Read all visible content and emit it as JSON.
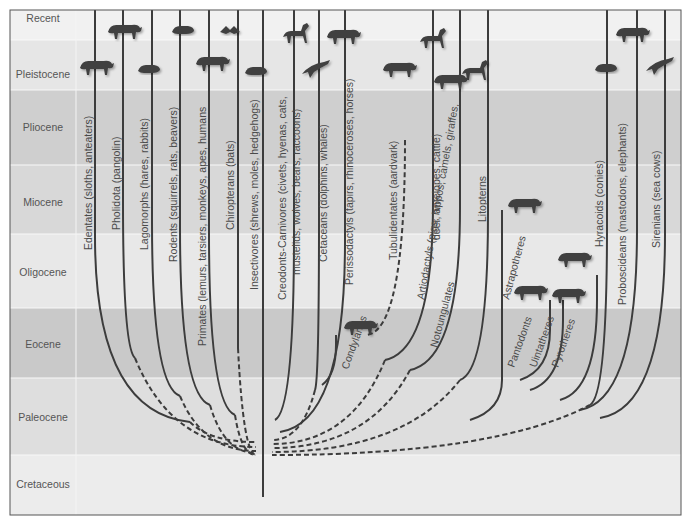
{
  "figure": {
    "type": "phylogenetic-tree",
    "topic": "Evolution of placental mammal orders through the Cenozoic",
    "frame": {
      "left": 10,
      "top": 10,
      "right": 681,
      "bottom": 515,
      "label_column_right": 76
    },
    "colors": {
      "line": "#3c3c3c",
      "animal": "#3f3f3f",
      "label_text": "#4a4a4a",
      "period_text": "#555555",
      "border": "#555555"
    }
  },
  "periods": [
    {
      "name": "Recent",
      "y0": 10,
      "y1": 40,
      "color": "#f1f1f1",
      "label_y": 22
    },
    {
      "name": "Pleistocene",
      "y0": 40,
      "y1": 90,
      "color": "#e6e6e6",
      "label_y": 78
    },
    {
      "name": "Pliocene",
      "y0": 90,
      "y1": 165,
      "color": "#cfcfcf",
      "label_y": 131
    },
    {
      "name": "Miocene",
      "y0": 165,
      "y1": 234,
      "color": "#d8d8d8",
      "label_y": 206
    },
    {
      "name": "Oligocene",
      "y0": 234,
      "y1": 308,
      "color": "#e8e8e8",
      "label_y": 276
    },
    {
      "name": "Eocene",
      "y0": 308,
      "y1": 378,
      "color": "#c9c9c9",
      "label_y": 348
    },
    {
      "name": "Paleocene",
      "y0": 378,
      "y1": 455,
      "color": "#dedede",
      "label_y": 421
    },
    {
      "name": "Cretaceous",
      "y0": 455,
      "y1": 515,
      "color": "#ececec",
      "label_y": 488
    }
  ],
  "groups": [
    {
      "label": "Edentates (sloths, anteaters)",
      "label_x": 92,
      "label_y": 250,
      "style": "solid"
    },
    {
      "label": "Pholidota (pangolin)",
      "label_x": 120,
      "label_y": 230,
      "style": "solid"
    },
    {
      "label": "Lagomorphs (hares, rabbits)",
      "label_x": 148,
      "label_y": 250,
      "style": "solid"
    },
    {
      "label": "Rodents (squirrels, rats, beavers)",
      "label_x": 177,
      "label_y": 262,
      "style": "solid"
    },
    {
      "label": "Primates (lemurs, tarsiers, monkeys, apes, humans",
      "label_x": 206,
      "label_y": 346,
      "style": "solid"
    },
    {
      "label": "Chiropterans (bats)",
      "label_x": 234,
      "label_y": 230,
      "style": "solid"
    },
    {
      "label": "Insectivores (shrews, moles, hedgehogs)",
      "label_x": 258,
      "label_y": 290,
      "style": "solid"
    },
    {
      "label": "Creodonts-Carnivores (civets, hyenas, cats,",
      "label_x": 286,
      "label_y": 300,
      "style": "solid"
    },
    {
      "label": "mustelids, wolves, bears, raccoons)",
      "label_x": 300,
      "label_y": 275,
      "style": "solid"
    },
    {
      "label": "Cetaceans (dolphins, whales)",
      "label_x": 327,
      "label_y": 262,
      "style": "solid"
    },
    {
      "label": "Perissodactyls (tapirs, rhinoceroses, horses)",
      "label_x": 353,
      "label_y": 285,
      "style": "solid"
    },
    {
      "label": "Tubulidentates (aardvark)",
      "label_x": 397,
      "label_y": 260,
      "style": "dashed"
    },
    {
      "label": "Condylarths",
      "label_x": 348,
      "label_y": 370,
      "style": "solid",
      "rotate": -70
    },
    {
      "label": "Artiodactyls (pigs, hippos, camels, giraffes,",
      "label_x": 424,
      "label_y": 300,
      "style": "solid",
      "rotate": -80
    },
    {
      "label": "deer, antelopes, cattle)",
      "label_x": 440,
      "label_y": 240,
      "style": "solid"
    },
    {
      "label": "Notoungulates",
      "label_x": 437,
      "label_y": 348,
      "style": "solid",
      "rotate": -75
    },
    {
      "label": "Litopterns",
      "label_x": 486,
      "label_y": 222,
      "style": "solid"
    },
    {
      "label": "Astrapotheres",
      "label_x": 509,
      "label_y": 300,
      "style": "solid",
      "rotate": -75
    },
    {
      "label": "Pantodonts",
      "label_x": 514,
      "label_y": 368,
      "style": "dashed",
      "rotate": -70
    },
    {
      "label": "Uintatheres",
      "label_x": 536,
      "label_y": 368,
      "style": "solid",
      "rotate": -70
    },
    {
      "label": "Pyrotheres",
      "label_x": 558,
      "label_y": 368,
      "style": "solid",
      "rotate": -70
    },
    {
      "label": "Hyracoids (conies)",
      "label_x": 603,
      "label_y": 247,
      "style": "solid"
    },
    {
      "label": "Proboscideans (mastodons, elephants)",
      "label_x": 626,
      "label_y": 305,
      "style": "solid"
    },
    {
      "label": "Sirenians (sea cows)",
      "label_x": 660,
      "label_y": 248,
      "style": "solid"
    }
  ],
  "lineages_left": [
    {
      "x_top": 95,
      "end": [
        190,
        422
      ],
      "dash_to": [
        256,
        442
      ]
    },
    {
      "x_top": 123,
      "end": [
        135,
        358
      ],
      "dash_to": [
        256,
        447
      ]
    },
    {
      "x_top": 152,
      "end": [
        180,
        396
      ],
      "dash_to": [
        256,
        451
      ]
    },
    {
      "x_top": 180,
      "end": [
        210,
        405
      ],
      "dash_to": [
        256,
        453
      ]
    },
    {
      "x_top": 209,
      "end": [
        235,
        415
      ],
      "dash_to": [
        256,
        455
      ]
    },
    {
      "x_top": 238,
      "end": [
        238,
        348
      ],
      "dash_to": [
        256,
        455
      ]
    }
  ],
  "trunk": {
    "x": 263,
    "y_top": 10,
    "y_bottom": 497
  },
  "lineages_right": [
    {
      "x_top": 294,
      "end": [
        275,
        420
      ],
      "style": "solid"
    },
    {
      "x_top": 319,
      "end": [
        315,
        390
      ],
      "dash_to": [
        272,
        440
      ]
    },
    {
      "x_top": 345,
      "end": [
        280,
        432
      ],
      "style": "solid"
    },
    {
      "x_top": 405,
      "from_y": 140,
      "dash_to": [
        365,
        335
      ],
      "style": "dashed"
    },
    {
      "x_top": 433,
      "end": [
        385,
        360
      ],
      "dash_to": [
        272,
        444
      ]
    },
    {
      "x_top": 460,
      "end": [
        410,
        370
      ],
      "dash_to": [
        272,
        448
      ]
    },
    {
      "x_top": 488,
      "end": [
        460,
        380
      ],
      "dash_to": [
        272,
        452
      ]
    },
    {
      "x_top": 607,
      "end": [
        590,
        405
      ],
      "dash_to": [
        272,
        455
      ]
    },
    {
      "x_top": 637,
      "end": [
        580,
        410
      ],
      "style": "solid"
    },
    {
      "x_top": 665,
      "end": [
        600,
        418
      ],
      "style": "solid"
    }
  ],
  "animals": [
    {
      "name": "anteater-silhouette",
      "x": 80,
      "y": 58
    },
    {
      "name": "pangolin-silhouette",
      "x": 108,
      "y": 22
    },
    {
      "name": "rabbit-silhouette",
      "x": 138,
      "y": 63
    },
    {
      "name": "squirrel-silhouette",
      "x": 172,
      "y": 24
    },
    {
      "name": "monkey-silhouette",
      "x": 196,
      "y": 54
    },
    {
      "name": "bat-silhouette",
      "x": 220,
      "y": 26
    },
    {
      "name": "shrew-silhouette",
      "x": 245,
      "y": 65
    },
    {
      "name": "cat-silhouette",
      "x": 283,
      "y": 23
    },
    {
      "name": "dolphin-silhouette",
      "x": 302,
      "y": 60
    },
    {
      "name": "rhinoceros-silhouette",
      "x": 327,
      "y": 27
    },
    {
      "name": "aardvark-silhouette",
      "x": 383,
      "y": 60
    },
    {
      "name": "camel-silhouette",
      "x": 420,
      "y": 28
    },
    {
      "name": "pig-silhouette",
      "x": 434,
      "y": 72
    },
    {
      "name": "giraffe-silhouette",
      "x": 462,
      "y": 60
    },
    {
      "name": "condylarth-silhouette",
      "x": 344,
      "y": 318
    },
    {
      "name": "astrapothere-silhouette",
      "x": 508,
      "y": 196
    },
    {
      "name": "pyrothere-silhouette",
      "x": 558,
      "y": 250
    },
    {
      "name": "pantodont-silhouette",
      "x": 514,
      "y": 283
    },
    {
      "name": "uintathere-silhouette",
      "x": 552,
      "y": 286
    },
    {
      "name": "hyrax-silhouette",
      "x": 595,
      "y": 62
    },
    {
      "name": "elephant-silhouette",
      "x": 616,
      "y": 25
    },
    {
      "name": "sea-cow-silhouette",
      "x": 646,
      "y": 57
    }
  ]
}
